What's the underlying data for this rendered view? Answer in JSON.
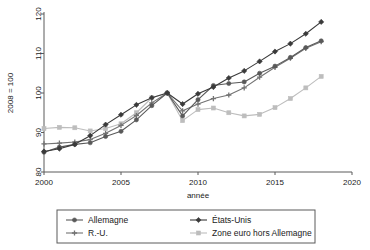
{
  "chart_data": {
    "type": "line",
    "title": "",
    "xlabel": "année",
    "ylabel": "2008 = 100",
    "xlim": [
      2000,
      2020
    ],
    "ylim": [
      80,
      120
    ],
    "xticks": [
      "2000",
      "2005",
      "2010",
      "2015",
      "2020"
    ],
    "yticks": [
      "80",
      "90",
      "100",
      "110",
      "120"
    ],
    "grid": false,
    "legend_position": "bottom",
    "x": [
      2000,
      2001,
      2002,
      2003,
      2004,
      2005,
      2006,
      2007,
      2008,
      2009,
      2010,
      2011,
      2012,
      2013,
      2014,
      2015,
      2016,
      2017,
      2018
    ],
    "series": [
      {
        "name": "Allemagne",
        "color": "#595959",
        "marker": "circle",
        "values": [
          85.0,
          86.3,
          87.0,
          87.4,
          89.0,
          90.3,
          93.2,
          96.8,
          100.0,
          94.2,
          98.3,
          101.9,
          102.4,
          102.8,
          105.0,
          106.8,
          109.0,
          111.5,
          113.2
        ]
      },
      {
        "name": "États-Unis",
        "color": "#3a3a3a",
        "marker": "diamond",
        "values": [
          85.2,
          85.9,
          87.0,
          89.2,
          92.0,
          94.5,
          97.0,
          98.8,
          100.0,
          97.2,
          99.8,
          101.5,
          103.8,
          105.6,
          108.0,
          110.5,
          112.5,
          115.0,
          118.0
        ]
      },
      {
        "name": "R.-U.",
        "color": "#737373",
        "marker": "plus",
        "values": [
          87.1,
          87.3,
          87.6,
          88.2,
          89.8,
          91.8,
          94.3,
          97.5,
          100.0,
          95.5,
          97.2,
          98.6,
          99.5,
          101.3,
          104.0,
          106.5,
          108.8,
          111.3,
          113.0
        ]
      },
      {
        "name": "Zone euro hors Allemagne",
        "color": "#bdbdbd",
        "marker": "square",
        "values": [
          91.0,
          91.3,
          91.2,
          90.4,
          91.0,
          92.2,
          95.0,
          98.8,
          100.0,
          93.0,
          95.8,
          96.2,
          95.0,
          94.2,
          94.6,
          96.3,
          98.6,
          101.3,
          104.2
        ]
      }
    ]
  },
  "legend": {
    "items": [
      {
        "label": "Allemagne"
      },
      {
        "label": "États-Unis"
      },
      {
        "label": "R.-U."
      },
      {
        "label": "Zone euro hors Allemagne"
      }
    ]
  }
}
